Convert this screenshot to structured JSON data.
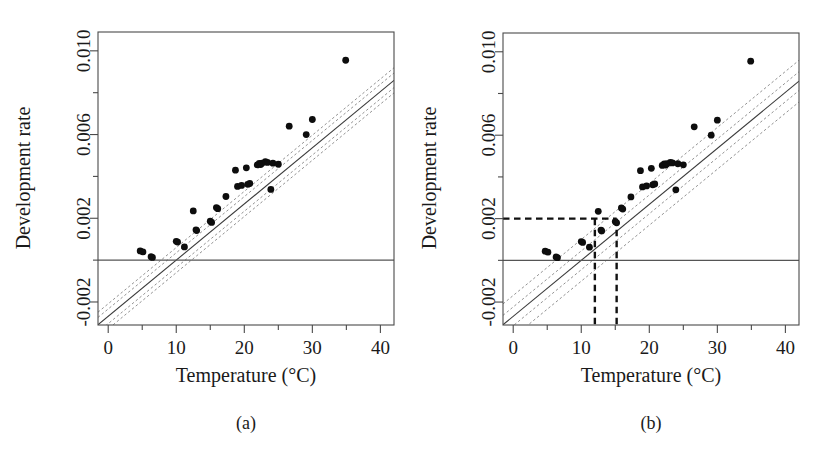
{
  "figure": {
    "panels": [
      {
        "id": "a",
        "caption": "(a)",
        "xlabel": "Temperature (°C)",
        "ylabel": "Development rate"
      },
      {
        "id": "b",
        "caption": "(b)",
        "xlabel": "Temperature (°C)",
        "ylabel": "Development rate"
      }
    ]
  },
  "chart_data": [
    {
      "type": "scatter",
      "panel": "a",
      "title": "",
      "xlabel": "Temperature (°C)",
      "ylabel": "Development rate",
      "xlim": [
        -1.5,
        42
      ],
      "ylim": [
        -0.0031,
        0.0109
      ],
      "xticks": [
        0,
        10,
        20,
        30,
        40
      ],
      "xtick_labels": [
        "0",
        "10",
        "20",
        "30",
        "40"
      ],
      "xminorticks": [
        5,
        15,
        25,
        35
      ],
      "yticks": [
        -0.002,
        0.002,
        0.006,
        0.01
      ],
      "ytick_labels": [
        "-0.002",
        "0.002",
        "0.006",
        "0.010"
      ],
      "yminorticks": [
        0.0,
        0.004,
        0.008
      ],
      "grid": false,
      "legend": "none",
      "zero_line": 0.0,
      "fit_line": {
        "name": "regression fit",
        "slope": 0.0002685,
        "intercept": -0.002685,
        "x_range": [
          -1.5,
          42
        ]
      },
      "bands": [
        {
          "name": "confidence lower",
          "slope": 0.0002685,
          "intercept": -0.003035,
          "style": "dashed"
        },
        {
          "name": "confidence upper",
          "slope": 0.0002685,
          "intercept": -0.002335,
          "style": "dashed"
        },
        {
          "name": "prediction lower",
          "slope": 0.0002685,
          "intercept": -0.003285,
          "style": "dashed"
        },
        {
          "name": "prediction upper",
          "slope": 0.0002685,
          "intercept": -0.002085,
          "style": "dashed"
        }
      ],
      "points": [
        {
          "x": 4.7,
          "y": 0.00044
        },
        {
          "x": 5.1,
          "y": 0.00039
        },
        {
          "x": 6.3,
          "y": 0.00016
        },
        {
          "x": 6.5,
          "y": 0.00013
        },
        {
          "x": 10.0,
          "y": 0.0009
        },
        {
          "x": 10.2,
          "y": 0.00086
        },
        {
          "x": 11.2,
          "y": 0.00063
        },
        {
          "x": 12.5,
          "y": 0.00235
        },
        {
          "x": 12.9,
          "y": 0.00145
        },
        {
          "x": 13.0,
          "y": 0.00141
        },
        {
          "x": 15.0,
          "y": 0.00186
        },
        {
          "x": 15.2,
          "y": 0.0018
        },
        {
          "x": 15.9,
          "y": 0.00251
        },
        {
          "x": 16.1,
          "y": 0.00246
        },
        {
          "x": 17.3,
          "y": 0.00304
        },
        {
          "x": 18.7,
          "y": 0.0043
        },
        {
          "x": 19.0,
          "y": 0.00352
        },
        {
          "x": 19.6,
          "y": 0.00357
        },
        {
          "x": 20.3,
          "y": 0.00441
        },
        {
          "x": 20.5,
          "y": 0.00362
        },
        {
          "x": 20.8,
          "y": 0.00366
        },
        {
          "x": 21.9,
          "y": 0.00455
        },
        {
          "x": 22.2,
          "y": 0.00462
        },
        {
          "x": 22.4,
          "y": 0.00457
        },
        {
          "x": 22.6,
          "y": 0.00463
        },
        {
          "x": 23.1,
          "y": 0.0047
        },
        {
          "x": 23.4,
          "y": 0.00467
        },
        {
          "x": 23.9,
          "y": 0.00338
        },
        {
          "x": 24.2,
          "y": 0.00463
        },
        {
          "x": 25.0,
          "y": 0.00458
        },
        {
          "x": 26.6,
          "y": 0.0064
        },
        {
          "x": 29.1,
          "y": 0.006
        },
        {
          "x": 30.0,
          "y": 0.00672
        },
        {
          "x": 34.9,
          "y": 0.00955
        }
      ]
    },
    {
      "type": "scatter",
      "panel": "b",
      "title": "",
      "xlabel": "Temperature (°C)",
      "ylabel": "Development rate",
      "xlim": [
        -1.5,
        42
      ],
      "ylim": [
        -0.0031,
        0.0109
      ],
      "xticks": [
        0,
        10,
        20,
        30,
        40
      ],
      "xtick_labels": [
        "0",
        "10",
        "20",
        "30",
        "40"
      ],
      "xminorticks": [
        5,
        15,
        25,
        35
      ],
      "yticks": [
        -0.002,
        0.002,
        0.006,
        0.01
      ],
      "ytick_labels": [
        "-0.002",
        "0.002",
        "0.006",
        "0.010"
      ],
      "yminorticks": [
        0.0,
        0.004,
        0.008
      ],
      "grid": false,
      "legend": "none",
      "zero_line": 0.0,
      "fit_line": {
        "name": "regression fit",
        "slope": 0.0002685,
        "intercept": -0.002685,
        "x_range": [
          -1.5,
          42
        ]
      },
      "bands": [
        {
          "name": "confidence lower",
          "slope": 0.0002685,
          "intercept": -0.003135,
          "style": "dashed"
        },
        {
          "name": "confidence upper",
          "slope": 0.0002685,
          "intercept": -0.002235,
          "style": "dashed"
        },
        {
          "name": "prediction lower",
          "slope": 0.0002685,
          "intercept": -0.003685,
          "style": "dashed"
        },
        {
          "name": "prediction upper",
          "slope": 0.0002685,
          "intercept": -0.001685,
          "style": "dashed"
        }
      ],
      "reference_lines": {
        "horizontal_y": 0.002,
        "vertical_x": [
          12.0,
          15.2
        ],
        "style": "heavy-dashed"
      },
      "points": [
        {
          "x": 4.7,
          "y": 0.00044
        },
        {
          "x": 5.1,
          "y": 0.00039
        },
        {
          "x": 6.3,
          "y": 0.00016
        },
        {
          "x": 6.5,
          "y": 0.00013
        },
        {
          "x": 10.0,
          "y": 0.0009
        },
        {
          "x": 10.2,
          "y": 0.00086
        },
        {
          "x": 11.2,
          "y": 0.00063
        },
        {
          "x": 12.5,
          "y": 0.00235
        },
        {
          "x": 12.9,
          "y": 0.00145
        },
        {
          "x": 13.0,
          "y": 0.00141
        },
        {
          "x": 15.0,
          "y": 0.00186
        },
        {
          "x": 15.2,
          "y": 0.0018
        },
        {
          "x": 15.9,
          "y": 0.00251
        },
        {
          "x": 16.1,
          "y": 0.00246
        },
        {
          "x": 17.3,
          "y": 0.00304
        },
        {
          "x": 18.7,
          "y": 0.0043
        },
        {
          "x": 19.0,
          "y": 0.00352
        },
        {
          "x": 19.6,
          "y": 0.00357
        },
        {
          "x": 20.3,
          "y": 0.00441
        },
        {
          "x": 20.5,
          "y": 0.00362
        },
        {
          "x": 20.8,
          "y": 0.00366
        },
        {
          "x": 21.9,
          "y": 0.00455
        },
        {
          "x": 22.2,
          "y": 0.00462
        },
        {
          "x": 22.4,
          "y": 0.00457
        },
        {
          "x": 22.6,
          "y": 0.00463
        },
        {
          "x": 23.1,
          "y": 0.0047
        },
        {
          "x": 23.4,
          "y": 0.00467
        },
        {
          "x": 23.9,
          "y": 0.00338
        },
        {
          "x": 24.2,
          "y": 0.00463
        },
        {
          "x": 25.0,
          "y": 0.00458
        },
        {
          "x": 26.6,
          "y": 0.0064
        },
        {
          "x": 29.1,
          "y": 0.006
        },
        {
          "x": 30.0,
          "y": 0.00672
        },
        {
          "x": 34.9,
          "y": 0.00955
        }
      ]
    }
  ]
}
